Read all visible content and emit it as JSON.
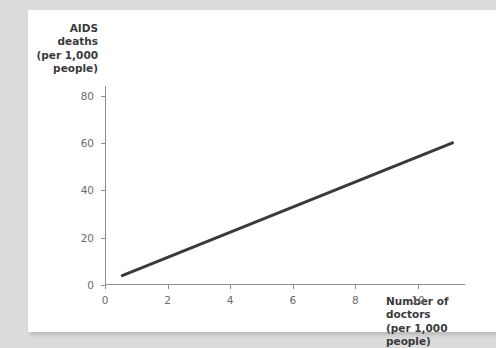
{
  "page": {
    "background_color": "#dcdcdc",
    "card_color": "#ffffff"
  },
  "chart_data": {
    "type": "line",
    "title": "",
    "ylabel": "AIDS\ndeaths\n(per 1,000\npeople)",
    "ylabel_lines": [
      "AIDS",
      "deaths",
      "(per 1,000",
      "people)"
    ],
    "xlabel": "Number of doctors\n(per 1,000 people)",
    "xlabel_lines": [
      "Number of doctors",
      "(per 1,000 people)"
    ],
    "xlim": [
      0,
      11.5
    ],
    "ylim": [
      0,
      84
    ],
    "xticks": [
      0,
      2,
      4,
      6,
      8,
      10
    ],
    "xtick_labels": [
      "0",
      "2",
      "4",
      "6",
      "8",
      "10"
    ],
    "yticks": [
      0,
      20,
      40,
      60,
      80
    ],
    "ytick_labels": [
      "0",
      "20",
      "40",
      "60",
      "80"
    ],
    "grid": false,
    "legend": "none",
    "series": [
      {
        "name": "AIDS deaths vs doctors",
        "color": "#3a3a3a",
        "line_width": 3,
        "x": [
          0.55,
          11.1
        ],
        "values": [
          4,
          60
        ]
      }
    ],
    "annotations": []
  },
  "axis_colors": {
    "axis_line": "#8d8d8d",
    "tick_label": "#6b6b6b",
    "axis_title": "#3a3a3a"
  }
}
